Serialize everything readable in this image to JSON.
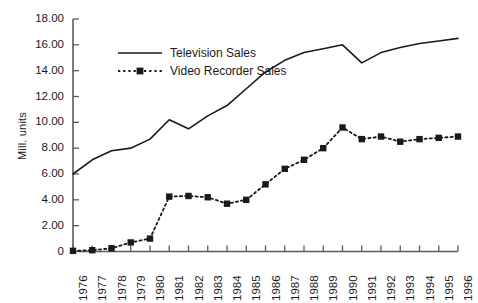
{
  "chart_data": {
    "type": "line",
    "title": "",
    "xlabel": "",
    "ylabel": "Mill. units",
    "ylim": [
      0,
      18
    ],
    "ytick_step": 2,
    "grid": false,
    "legend_position": "top-left-inside",
    "categories": [
      "1976",
      "1977",
      "1978",
      "1979",
      "1980",
      "1981",
      "1982",
      "1983",
      "1984",
      "1985",
      "1986",
      "1987",
      "1988",
      "1989",
      "1990",
      "1991",
      "1992",
      "1993",
      "1994",
      "1995",
      "1996"
    ],
    "ytick_labels": [
      "18.00",
      "16.00",
      "14.00",
      "12.00",
      "10.00",
      "8.00",
      "6.00",
      "4.00",
      "2.00",
      "0"
    ],
    "ytick_values": [
      18,
      16,
      14,
      12,
      10,
      8,
      6,
      4,
      2,
      0
    ],
    "series": [
      {
        "name": "Television Sales",
        "style": "solid-line",
        "marker": "none",
        "color": "#1a1a1a",
        "values": [
          6.0,
          7.1,
          7.8,
          8.0,
          8.7,
          10.2,
          9.5,
          10.5,
          11.3,
          12.6,
          13.9,
          14.8,
          15.4,
          15.7,
          16.0,
          14.6,
          15.4,
          15.8,
          16.1,
          16.3,
          16.5
        ]
      },
      {
        "name": "Video Recorder Sales",
        "style": "dotted-line",
        "marker": "square",
        "color": "#1a1a1a",
        "values": [
          0.05,
          0.1,
          0.25,
          0.7,
          1.0,
          4.25,
          4.3,
          4.2,
          3.7,
          4.0,
          5.2,
          6.4,
          7.1,
          8.0,
          9.6,
          8.7,
          8.9,
          8.5,
          8.7,
          8.8,
          8.9
        ]
      }
    ],
    "legend": [
      {
        "label": "Television Sales",
        "style": "solid-line",
        "marker": "none"
      },
      {
        "label": "Video Recorder Sales",
        "style": "dotted-line",
        "marker": "square"
      }
    ],
    "colors": {
      "ink": "#1a1a1a",
      "axis": "#5a5a5a",
      "background": "#ffffff"
    }
  }
}
